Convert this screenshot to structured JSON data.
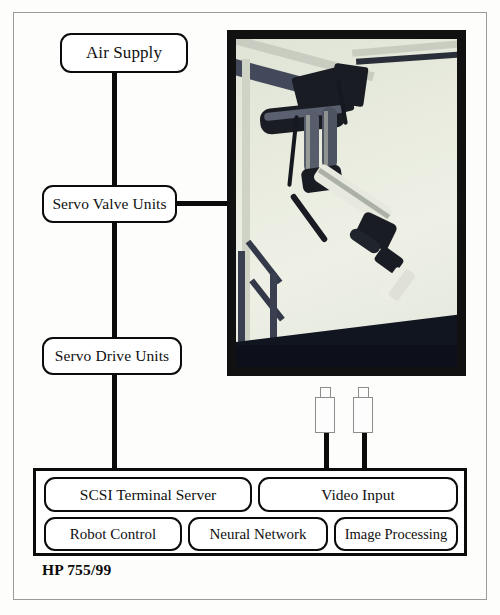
{
  "figure": {
    "caption": "HP 755/99",
    "nodes": {
      "air_supply": "Air Supply",
      "servo_valve_units": "Servo Valve Units",
      "servo_drive_units": "Servo Drive Units"
    },
    "chassis": {
      "scsi_terminal_server": "SCSI Terminal Server",
      "video_input": "Video Input",
      "robot_control": "Robot Control",
      "neural_network": "Neural Network",
      "image_processing": "Image Processing"
    },
    "photo": {
      "alt": "Photograph of a pneumatic robot arm suspended from an overhead gantry frame above a dark table"
    },
    "cameras": [
      {
        "label": "camera-1"
      },
      {
        "label": "camera-2"
      }
    ],
    "colors": {
      "line": "#0b0b0b",
      "box_border": "#0b0b0b",
      "frame_border": "#9a9a99",
      "background": "#fdfdfc",
      "photo_border": "#111111"
    }
  }
}
